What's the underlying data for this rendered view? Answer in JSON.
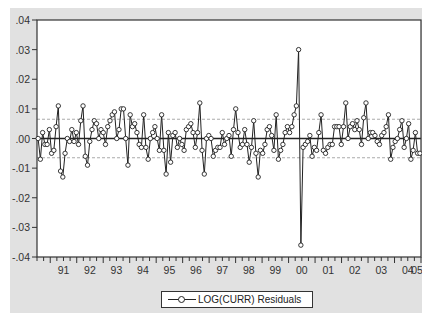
{
  "chart_data": {
    "type": "line",
    "title": "",
    "xlabel": "",
    "ylabel": "",
    "ylim": [
      -0.04,
      0.04
    ],
    "yticks": [
      ".04",
      ".03",
      ".02",
      ".01",
      ".00",
      "-.01",
      "-.02",
      "-.03",
      "-.04"
    ],
    "xticks": [
      "91",
      "92",
      "93",
      "94",
      "95",
      "96",
      "97",
      "98",
      "99",
      "00",
      "01",
      "02",
      "03",
      "04",
      "05"
    ],
    "x_start_year": 1990.5,
    "x_end_year": 2005.0,
    "grid": false,
    "reference_lines": {
      "zero": 0.0,
      "bands": [
        0.0065,
        -0.0065
      ]
    },
    "legend": {
      "position": "bottom",
      "entries": [
        "LOG(CURR) Residuals"
      ]
    },
    "series": [
      {
        "name": "LOG(CURR) Residuals",
        "values": [
          0.0,
          -0.007,
          0.002,
          -0.002,
          -0.002,
          0.003,
          -0.005,
          -0.004,
          0.004,
          0.011,
          -0.011,
          -0.013,
          -0.005,
          0.0,
          -0.001,
          0.003,
          -0.001,
          0.002,
          -0.002,
          0.006,
          0.011,
          -0.006,
          -0.009,
          -0.001,
          0.003,
          0.006,
          0.005,
          0.0,
          0.003,
          0.002,
          -0.002,
          0.004,
          0.006,
          0.008,
          0.009,
          0.0,
          0.003,
          0.01,
          0.01,
          0.0,
          -0.009,
          0.008,
          0.004,
          0.005,
          0.002,
          -0.002,
          -0.003,
          0.008,
          -0.003,
          -0.007,
          0.0,
          0.002,
          0.004,
          0.0,
          -0.004,
          0.008,
          -0.004,
          -0.012,
          0.002,
          -0.008,
          0.001,
          0.002,
          -0.003,
          0.0,
          -0.002,
          -0.004,
          0.003,
          0.004,
          0.005,
          0.002,
          -0.003,
          0.002,
          0.012,
          -0.004,
          -0.012,
          0.0,
          0.001,
          0.0,
          -0.006,
          -0.004,
          -0.003,
          -0.003,
          0.002,
          -0.002,
          0.0,
          0.001,
          -0.006,
          0.003,
          0.01,
          0.002,
          -0.003,
          -0.002,
          0.003,
          -0.002,
          -0.008,
          -0.003,
          0.006,
          -0.005,
          -0.013,
          -0.004,
          -0.005,
          -0.002,
          0.003,
          0.004,
          0.001,
          -0.004,
          0.008,
          -0.007,
          -0.004,
          -0.002,
          0.002,
          0.004,
          0.002,
          0.004,
          0.008,
          0.011,
          0.03,
          -0.036,
          -0.003,
          -0.002,
          -0.001,
          0.001,
          -0.006,
          -0.003,
          -0.004,
          0.002,
          0.008,
          -0.004,
          -0.005,
          -0.003,
          -0.002,
          -0.002,
          0.004,
          0.004,
          0.004,
          -0.002,
          0.004,
          0.012,
          0.0,
          0.004,
          0.005,
          0.003,
          0.006,
          0.003,
          -0.002,
          0.007,
          0.012,
          0.0,
          0.002,
          0.002,
          0.001,
          -0.001,
          -0.002,
          0.001,
          0.002,
          0.004,
          0.008,
          -0.007,
          -0.003,
          -0.001,
          0.0,
          0.003,
          0.006,
          -0.003,
          0.0,
          0.005,
          -0.007,
          -0.004,
          0.002,
          -0.005,
          -0.005
        ]
      }
    ]
  },
  "legend": {
    "label": "LOG(CURR) Residuals"
  }
}
